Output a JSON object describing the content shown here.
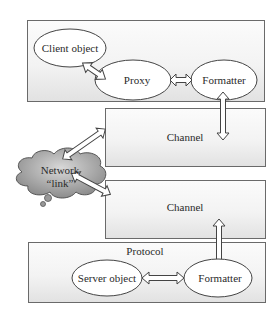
{
  "diagram": {
    "client_box": {
      "client_object": "Client object",
      "proxy": "Proxy",
      "formatter": "Formatter"
    },
    "channel_top": {
      "label": "Channel"
    },
    "network": {
      "line1": "Network",
      "line2": "“link”"
    },
    "channel_bottom": {
      "label": "Channel"
    },
    "server_box": {
      "title": "Protocol",
      "server_object": "Server object",
      "formatter": "Formatter"
    },
    "colors": {
      "border": "#6a6a6a",
      "cloud_fill": "#9a9a9a",
      "arrow_fill": "#ffffff"
    }
  }
}
